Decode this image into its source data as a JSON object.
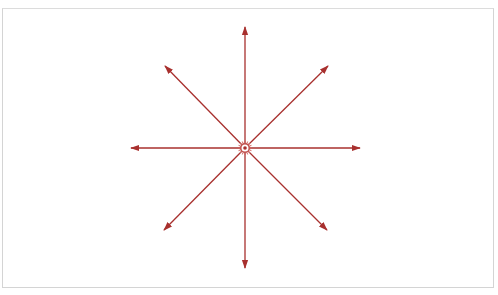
{
  "diagram": {
    "type": "radial-arrows",
    "center": {
      "x": 245,
      "y": 148
    },
    "color": "#a8302e",
    "arrows": [
      {
        "direction": "up",
        "x": 245,
        "y": 27
      },
      {
        "direction": "down",
        "x": 245,
        "y": 268
      },
      {
        "direction": "left",
        "x": 131,
        "y": 148
      },
      {
        "direction": "right",
        "x": 360,
        "y": 148
      },
      {
        "direction": "up-left",
        "x": 165,
        "y": 66
      },
      {
        "direction": "up-right",
        "x": 328,
        "y": 66
      },
      {
        "direction": "down-left",
        "x": 164,
        "y": 230
      },
      {
        "direction": "down-right",
        "x": 327,
        "y": 230
      }
    ]
  }
}
